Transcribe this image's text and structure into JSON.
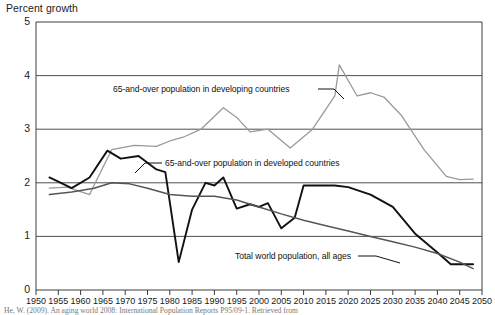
{
  "chart_data": {
    "type": "line",
    "title": "Percent growth",
    "xlabel": "",
    "ylabel": "Percent growth",
    "xlim": [
      1950,
      2050
    ],
    "ylim": [
      0,
      5
    ],
    "grid": true,
    "legend_position": "inline-annotations",
    "yticks": [
      "0",
      "1",
      "2",
      "3",
      "4",
      "5"
    ],
    "xticks": [
      "1950",
      "1955",
      "1960",
      "1965",
      "1970",
      "1975",
      "1980",
      "1985",
      "1990",
      "1995",
      "2000",
      "2005",
      "2010",
      "2015",
      "2020",
      "2025",
      "2030",
      "2035",
      "2040",
      "2045",
      "2050"
    ],
    "series": [
      {
        "name": "65-and-over population in developing countries",
        "color": "#9a9a9a",
        "x": [
          1953,
          1957,
          1962,
          1963,
          1967,
          1972,
          1977,
          1980,
          1983,
          1987,
          1992,
          1995,
          1998,
          2002,
          2007,
          2012,
          2017,
          2018,
          2022,
          2025,
          2028,
          2032,
          2037,
          2042,
          2045,
          2048
        ],
        "values": [
          1.9,
          1.92,
          1.78,
          1.95,
          2.62,
          2.7,
          2.68,
          2.78,
          2.85,
          3.0,
          3.4,
          3.22,
          2.95,
          3.0,
          2.65,
          3.0,
          3.62,
          4.2,
          3.62,
          3.68,
          3.6,
          3.25,
          2.62,
          2.12,
          2.06,
          2.07
        ]
      },
      {
        "name": "65-and-over population in developed countries",
        "color": "#111111",
        "x": [
          1953,
          1955,
          1958,
          1962,
          1966,
          1969,
          1973,
          1977,
          1979,
          1982,
          1985,
          1988,
          1990,
          1992,
          1995,
          1998,
          2000,
          2002,
          2005,
          2008,
          2010,
          2013,
          2017,
          2020,
          2025,
          2030,
          2035,
          2040,
          2043,
          2048
        ],
        "values": [
          2.1,
          2.02,
          1.9,
          2.1,
          2.6,
          2.45,
          2.5,
          2.25,
          2.2,
          0.52,
          1.5,
          2.0,
          1.95,
          2.1,
          1.52,
          1.6,
          1.55,
          1.62,
          1.15,
          1.35,
          1.95,
          1.95,
          1.95,
          1.92,
          1.78,
          1.55,
          1.05,
          0.7,
          0.48,
          0.48
        ]
      },
      {
        "name": "Total world population, all ages",
        "color": "#555555",
        "x": [
          1953,
          1958,
          1963,
          1967,
          1971,
          1975,
          1980,
          1985,
          1990,
          1995,
          2000,
          2005,
          2010,
          2015,
          2020,
          2025,
          2030,
          2035,
          2040,
          2045,
          2048
        ],
        "values": [
          1.78,
          1.83,
          1.9,
          2.0,
          1.98,
          1.9,
          1.78,
          1.75,
          1.75,
          1.68,
          1.55,
          1.42,
          1.3,
          1.2,
          1.1,
          1.0,
          0.9,
          0.8,
          0.68,
          0.52,
          0.4
        ]
      }
    ],
    "annotations": [
      {
        "text": "65-and-over population in developing countries",
        "x_px": 113,
        "y_px": 84,
        "leader": true
      },
      {
        "text": "65-and-over population in developed countries",
        "x_px": 165,
        "y_px": 158,
        "leader": true
      },
      {
        "text": "Total world population, all ages",
        "x_px": 235,
        "y_px": 251,
        "leader": true
      }
    ]
  },
  "source": {
    "note": "He, W. (2009). An aging world 2008: International Population Reports P95/09-1. Retrieved from"
  }
}
